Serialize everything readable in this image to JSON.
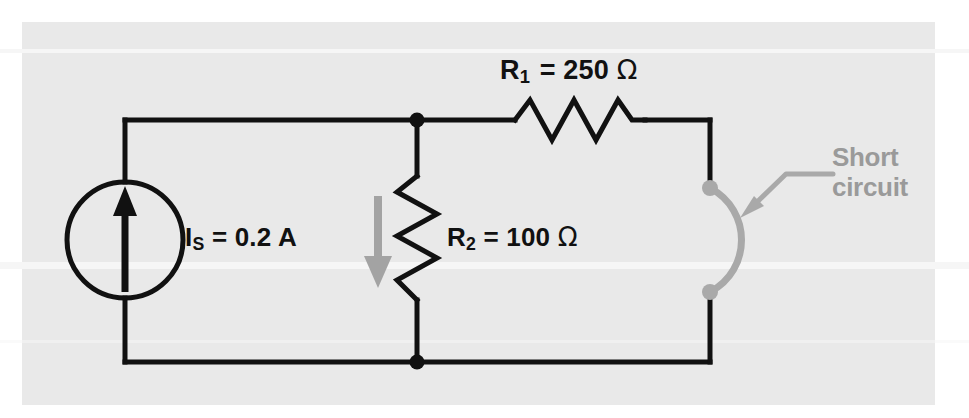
{
  "figure": {
    "kind": "circuit-schematic",
    "background_color": "#e9e9e9",
    "page_color": "#ffffff",
    "wire_color": "#111111",
    "annotation_color": "#9a9a9a"
  },
  "labels": {
    "source": {
      "symbol": "I",
      "subscript": "S",
      "equals": "=",
      "value": "0.2 A",
      "full_text": "IS = 0.2 A"
    },
    "r1": {
      "symbol": "R",
      "subscript": "1",
      "equals": "=",
      "value": "250",
      "unit": "Ω",
      "full_text": "R1 = 250 Ω"
    },
    "r2": {
      "symbol": "R",
      "subscript": "2",
      "equals": "=",
      "value": "100",
      "unit": "Ω",
      "full_text": "R2 = 100 Ω"
    },
    "annotation": {
      "text": "Short\ncircuit",
      "line1": "Short",
      "line2": "circuit",
      "color": "#9a9a9a"
    }
  },
  "components": {
    "current_source": {
      "name": "current-source",
      "direction": "up",
      "label_ref": "labels.source.full_text"
    },
    "resistor_1": {
      "name": "resistor-r1",
      "orientation": "horizontal",
      "label_ref": "labels.r1.full_text"
    },
    "resistor_2": {
      "name": "resistor-r2",
      "orientation": "vertical",
      "label_ref": "labels.r2.full_text"
    },
    "short_circuit": {
      "name": "short-circuit-arc",
      "shape": "arc",
      "color": "#9a9a9a"
    },
    "current_arrow": {
      "name": "branch-current-arrow",
      "direction": "down",
      "color": "#9a9a9a"
    }
  }
}
